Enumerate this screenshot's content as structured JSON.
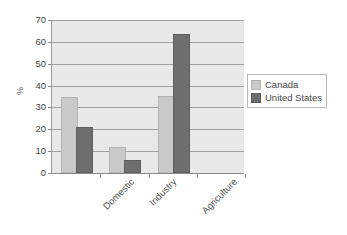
{
  "chart_data": {
    "type": "bar",
    "title": "",
    "xlabel": "",
    "ylabel": "%",
    "categories": [
      "Domestic",
      "Industry",
      "Agriculture"
    ],
    "series": [
      {
        "name": "Canada",
        "color": "#c9c9c9",
        "values": [
          34,
          11,
          34.5
        ]
      },
      {
        "name": "United States",
        "color": "#6e6e6e",
        "values": [
          20,
          5,
          62.5
        ]
      }
    ],
    "ylim": [
      0,
      70
    ],
    "ytick_step": 10,
    "ytick_labels": [
      "70",
      "60",
      "50",
      "40",
      "30",
      "20",
      "10",
      "0"
    ],
    "grid": true,
    "legend_position": "right",
    "plot_background": "#e8e8e8",
    "gridline_color": "#9e9e9e",
    "empty_trailing_slot": true
  }
}
